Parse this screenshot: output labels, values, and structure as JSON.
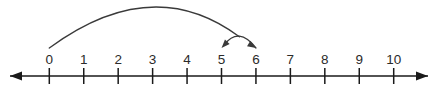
{
  "figure": {
    "name": "number-line-with-jumps",
    "background_color": "#ffffff",
    "line_color": "#1a1a1a",
    "arc_color": "#3a3a3a",
    "label_color": "#2b2b2b"
  },
  "number_line": {
    "min": 0,
    "max": 10,
    "tick_values": [
      0,
      1,
      2,
      3,
      4,
      5,
      6,
      7,
      8,
      9,
      10
    ],
    "tick_labels": [
      "0",
      "1",
      "2",
      "3",
      "4",
      "5",
      "6",
      "7",
      "8",
      "9",
      "10"
    ],
    "left_arrow": true,
    "right_arrow": true,
    "axis_y": 76,
    "tick_half_height": 8,
    "first_tick_x": 49.3,
    "tick_spacing": 34.44,
    "line_start_x": 10,
    "line_end_x": 428
  },
  "jumps": [
    {
      "name": "jump-zero-to-six",
      "from": 0,
      "to": 6,
      "direction": "forward",
      "magnitude": 6,
      "arrowhead_at": "to",
      "arc_height": 38
    },
    {
      "name": "jump-six-to-five",
      "from": 6,
      "to": 5,
      "direction": "backward",
      "magnitude": 1,
      "arrowhead_at": "to",
      "arc_height": 11
    }
  ],
  "chart_data": {
    "type": "line",
    "title": "",
    "xlabel": "",
    "ylabel": "",
    "categories": [
      "0",
      "1",
      "2",
      "3",
      "4",
      "5",
      "6",
      "7",
      "8",
      "9",
      "10"
    ],
    "x": [
      0,
      1,
      2,
      3,
      4,
      5,
      6,
      7,
      8,
      9,
      10
    ],
    "values": [
      0,
      0,
      0,
      0,
      0,
      0,
      0,
      0,
      0,
      0,
      0
    ],
    "xlim": [
      0,
      10
    ],
    "grid": false,
    "legend": "none",
    "annotations": [
      {
        "label": "arc from 0 to 6",
        "start": 0,
        "end": 6,
        "arrow": "end"
      },
      {
        "label": "arc from 6 to 5",
        "start": 6,
        "end": 5,
        "arrow": "end"
      }
    ]
  }
}
